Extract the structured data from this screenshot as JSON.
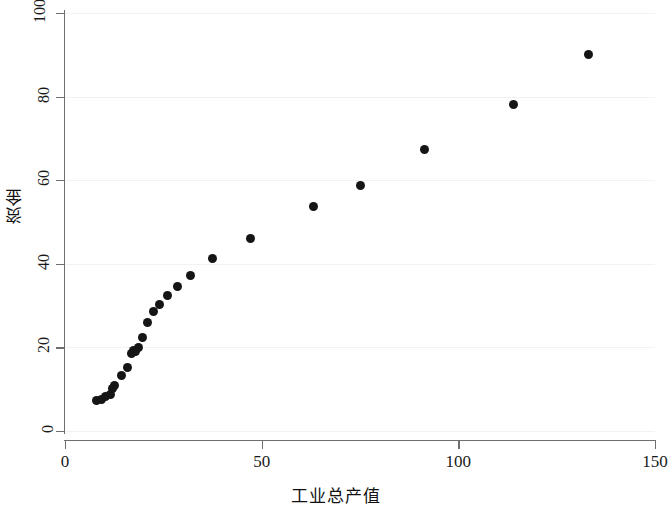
{
  "chart_data": {
    "type": "scatter",
    "title": "",
    "xlabel": "工业总产值",
    "ylabel": "资金",
    "xlim": [
      0,
      150
    ],
    "ylim": [
      0,
      100
    ],
    "xticks": [
      0,
      50,
      100,
      150
    ],
    "yticks": [
      0,
      20,
      40,
      60,
      80,
      100
    ],
    "grid": "horizontal",
    "legend": "none",
    "marker": "filled-circle",
    "marker_color": "#151515",
    "points": [
      {
        "x": 8.0,
        "y": 7.3
      },
      {
        "x": 9.2,
        "y": 7.6
      },
      {
        "x": 10.4,
        "y": 8.2
      },
      {
        "x": 11.5,
        "y": 8.8
      },
      {
        "x": 12.2,
        "y": 10.2
      },
      {
        "x": 12.6,
        "y": 11.0
      },
      {
        "x": 14.4,
        "y": 13.2
      },
      {
        "x": 15.8,
        "y": 15.3
      },
      {
        "x": 16.8,
        "y": 18.6
      },
      {
        "x": 17.4,
        "y": 19.3
      },
      {
        "x": 18.0,
        "y": 19.1
      },
      {
        "x": 18.6,
        "y": 20.0
      },
      {
        "x": 19.6,
        "y": 22.4
      },
      {
        "x": 21.0,
        "y": 26.0
      },
      {
        "x": 22.4,
        "y": 28.6
      },
      {
        "x": 24.0,
        "y": 30.3
      },
      {
        "x": 26.0,
        "y": 32.3
      },
      {
        "x": 28.6,
        "y": 34.5
      },
      {
        "x": 32.0,
        "y": 37.3
      },
      {
        "x": 37.4,
        "y": 41.2
      },
      {
        "x": 47.2,
        "y": 46.1
      },
      {
        "x": 63.2,
        "y": 53.6
      },
      {
        "x": 75.2,
        "y": 58.8
      },
      {
        "x": 91.4,
        "y": 67.4
      },
      {
        "x": 114.0,
        "y": 78.2
      },
      {
        "x": 133.2,
        "y": 90.0
      }
    ]
  },
  "axes": {
    "y_tick_labels": [
      "0",
      "20",
      "40",
      "60",
      "80",
      "100"
    ],
    "x_tick_labels": [
      "0",
      "50",
      "100",
      "150"
    ]
  }
}
